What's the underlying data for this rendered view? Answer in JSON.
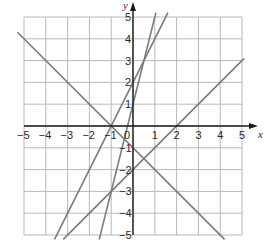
{
  "chart_data": {
    "type": "line",
    "title": "",
    "xlabel": "x",
    "ylabel": "y",
    "xlim": [
      -5,
      5
    ],
    "ylim": [
      -5,
      5
    ],
    "grid": true,
    "x_ticks": [
      -5,
      -4,
      -3,
      -2,
      -1,
      0,
      1,
      2,
      3,
      4,
      5
    ],
    "y_ticks": [
      -5,
      -4,
      -3,
      -2,
      -1,
      1,
      2,
      3,
      4,
      5
    ],
    "x_tick_labels": [
      "−5",
      "−4",
      "−3",
      "−2",
      "−1",
      "0",
      "1",
      "2",
      "3",
      "4",
      "5"
    ],
    "y_tick_labels": [
      "−5",
      "−4",
      "−3",
      "−2",
      "−1",
      "1",
      "2",
      "3",
      "4",
      "5"
    ],
    "series": [
      {
        "name": "y = -x - 1",
        "slope": -1,
        "intercept": -1,
        "points": [
          [
            -5.3,
            4.3
          ],
          [
            4.2,
            -5.2
          ]
        ]
      },
      {
        "name": "y = x - 2",
        "slope": 1,
        "intercept": -2,
        "points": [
          [
            -3.2,
            -5.2
          ],
          [
            5.1,
            3.1
          ]
        ]
      },
      {
        "name": "y = 2x + 2",
        "slope": 2,
        "intercept": 2,
        "points": [
          [
            -3.6,
            -5.2
          ],
          [
            1.6,
            5.2
          ]
        ]
      },
      {
        "name": "y = 4x + 1",
        "slope": 4,
        "intercept": 1,
        "points": [
          [
            -1.55,
            -5.2
          ],
          [
            1.05,
            5.2
          ]
        ]
      }
    ],
    "colors": {
      "line": "#7a7a7a",
      "grid": "#b8b8b8",
      "axis": "#1a1a1a"
    }
  }
}
